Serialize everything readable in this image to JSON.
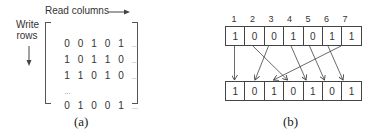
{
  "panel_a": {
    "read_label": "Read columns",
    "write_label_line1": "Write",
    "write_label_line2": "rows",
    "matrix_rows": [
      [
        "0",
        "0",
        "1",
        "0",
        "1",
        "..."
      ],
      [
        "1",
        "0",
        "1",
        "1",
        "0",
        "..."
      ],
      [
        "1",
        "1",
        "0",
        "1",
        "0",
        "..."
      ],
      [
        "..."
      ],
      [
        "0",
        "1",
        "0",
        "0",
        "1",
        "..."
      ]
    ],
    "caption": "(a)"
  },
  "panel_b": {
    "indices": [
      "1",
      "2",
      "3",
      "4",
      "5",
      "6",
      "7"
    ],
    "top_row": [
      "1",
      "0",
      "0",
      "1",
      "0",
      "1",
      "1"
    ],
    "bottom_row": [
      "1",
      "0",
      "1",
      "0",
      "1",
      "0",
      "1"
    ],
    "mapping_top_to_bottom": [
      [
        1,
        1
      ],
      [
        2,
        4
      ],
      [
        3,
        2
      ],
      [
        4,
        5
      ],
      [
        5,
        6
      ],
      [
        6,
        7
      ],
      [
        7,
        3
      ]
    ],
    "caption": "(b)"
  }
}
